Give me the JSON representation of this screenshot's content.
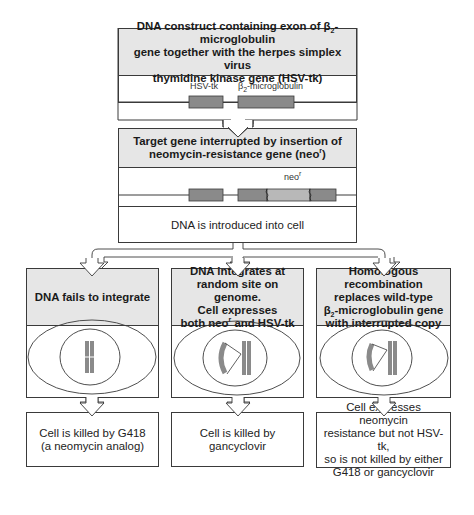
{
  "construct_box": {
    "title_line1": "DNA construct containing exon of β",
    "title_sub": "2",
    "title_line1_rest": "-microglobulin",
    "title_line2": "gene together with the herpes simplex virus",
    "title_line3": "thymidine kinase gene (HSV-tk)",
    "gene_labels": {
      "hsv_tk": "HSV-tk",
      "b2_prefix": "β",
      "b2_sub": "2",
      "b2_rest": "-microglobulin"
    }
  },
  "target_box": {
    "title_line1": "Target gene interrupted by insertion of",
    "title_line2_pre": "neomycin-resistance gene (neo",
    "title_line2_sup": "r",
    "title_line2_post": ")",
    "neo_label": "neo",
    "neo_sup": "r",
    "step_text": "DNA is introduced into cell"
  },
  "outcomes": [
    {
      "title": "DNA fails to integrate",
      "result_line1": "Cell is killed by G418",
      "result_line2": "(a neomycin analog)"
    },
    {
      "title_line1": "DNA integrates at",
      "title_line2": "random site on genome.",
      "title_line3": "Cell expresses",
      "title_line4_pre": "both neo",
      "title_line4_sup": "r",
      "title_line4_post": " and HSV-tk",
      "result_line1": "Cell is killed by gancyclovir"
    },
    {
      "title_line1": "Homologous recombination",
      "title_line2": "replaces wild-type",
      "title_line3_pre": "β",
      "title_line3_sub": "2",
      "title_line3_post": "-microglobulin gene",
      "title_line4": "with interrupted copy",
      "result_line1": "Cell expresses neomycin",
      "result_line2": "resistance but not HSV-tk,",
      "result_line3": "so is not killed by either",
      "result_line4": "G418 or gancyclovir"
    }
  ],
  "colors": {
    "header_fill": "#e6e6e6",
    "gene_dark": "#8a8a8a",
    "gene_light": "#b8b8b8",
    "line": "#3a3a3a"
  }
}
